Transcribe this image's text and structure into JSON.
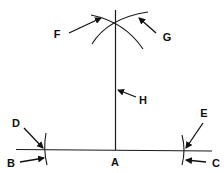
{
  "diagram": {
    "title": "",
    "colors": {
      "stroke": "#1a1a1a",
      "background": "#ffffff"
    },
    "labels": {
      "A": "A",
      "B": "B",
      "C": "C",
      "D": "D",
      "E": "E",
      "F": "F",
      "G": "G",
      "H": "H"
    },
    "elements": [
      {
        "label": "A",
        "refers_to": "point on base line at foot of perpendicular"
      },
      {
        "label": "B",
        "refers_to": "left intersection point on base line"
      },
      {
        "label": "C",
        "refers_to": "right intersection point on base line"
      },
      {
        "label": "D",
        "refers_to": "left arc crossing base line"
      },
      {
        "label": "E",
        "refers_to": "right arc crossing base line"
      },
      {
        "label": "F",
        "refers_to": "upper arc (left)"
      },
      {
        "label": "G",
        "refers_to": "upper arc (right)"
      },
      {
        "label": "H",
        "refers_to": "perpendicular line"
      }
    ]
  }
}
